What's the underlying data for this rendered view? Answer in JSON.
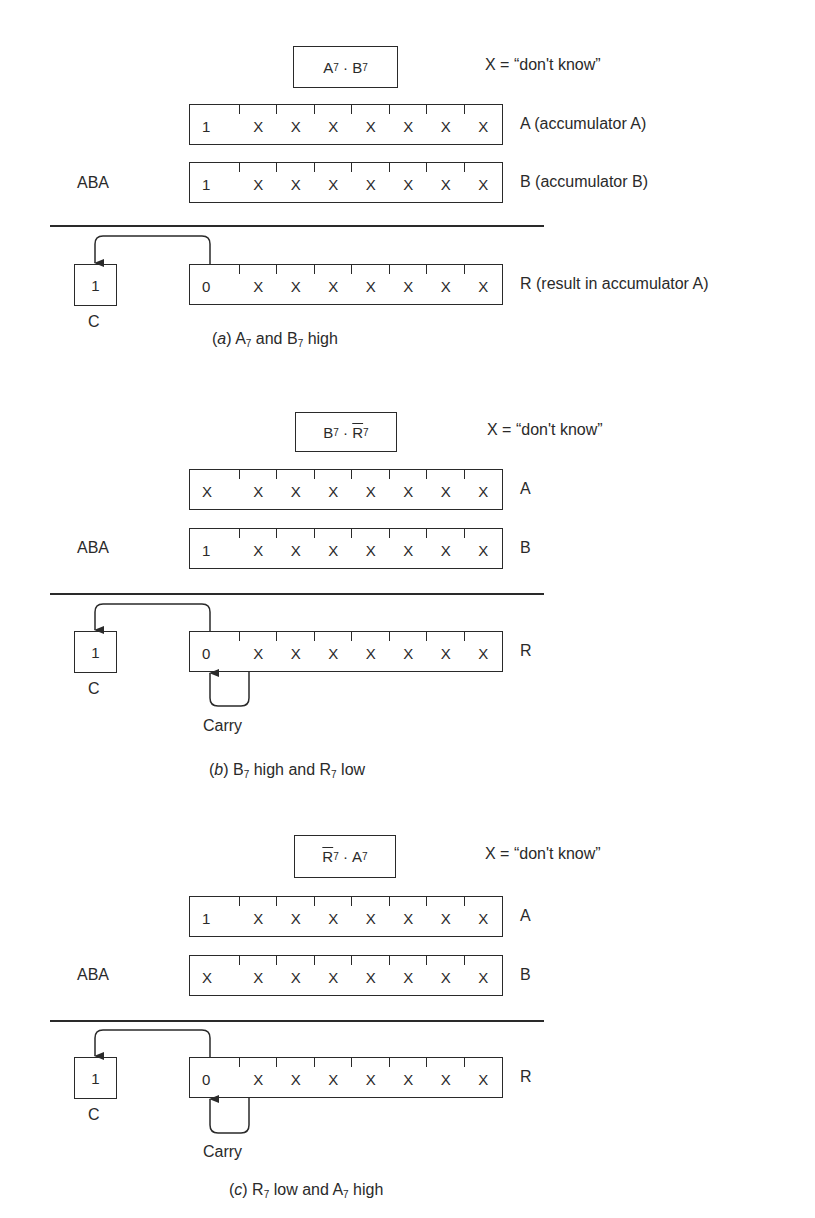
{
  "legend": "X = “don't know”",
  "operation": "ABA",
  "carry_flag_label": "C",
  "carry_text": "Carry",
  "panels": [
    {
      "id": "a",
      "condition": {
        "t1": "A",
        "s1": "7",
        "dot": "·",
        "t2": "B",
        "s2": "7",
        "overline": "none"
      },
      "registers": [
        {
          "name": "A",
          "label": "A (accumulator A)",
          "bits": [
            "1",
            "X",
            "X",
            "X",
            "X",
            "X",
            "X",
            "X"
          ]
        },
        {
          "name": "B",
          "label": "B (accumulator B)",
          "bits": [
            "1",
            "X",
            "X",
            "X",
            "X",
            "X",
            "X",
            "X"
          ]
        },
        {
          "name": "R",
          "label": "R (result in accumulator A)",
          "bits": [
            "0",
            "X",
            "X",
            "X",
            "X",
            "X",
            "X",
            "X"
          ]
        }
      ],
      "carry_value": "1",
      "caption": {
        "letter": "a",
        "text": "A₇ and B₇ high",
        "p1": "A",
        "s1": "7",
        "mid": " and ",
        "p2": "B",
        "s2": "7",
        "end": " high"
      },
      "has_internal_carry": false
    },
    {
      "id": "b",
      "condition": {
        "t1": "B",
        "s1": "7",
        "dot": "·",
        "t2": "R",
        "s2": "7",
        "overline": "second"
      },
      "registers": [
        {
          "name": "A",
          "label": "A",
          "bits": [
            "X",
            "X",
            "X",
            "X",
            "X",
            "X",
            "X",
            "X"
          ]
        },
        {
          "name": "B",
          "label": "B",
          "bits": [
            "1",
            "X",
            "X",
            "X",
            "X",
            "X",
            "X",
            "X"
          ]
        },
        {
          "name": "R",
          "label": "R",
          "bits": [
            "0",
            "X",
            "X",
            "X",
            "X",
            "X",
            "X",
            "X"
          ]
        }
      ],
      "carry_value": "1",
      "caption": {
        "letter": "b",
        "p1": "B",
        "s1": "7",
        "mid": " high and ",
        "p2": "R",
        "s2": "7",
        "end": " low"
      },
      "has_internal_carry": true
    },
    {
      "id": "c",
      "condition": {
        "t1": "R",
        "s1": "7",
        "dot": "·",
        "t2": "A",
        "s2": "7",
        "overline": "first"
      },
      "registers": [
        {
          "name": "A",
          "label": "A",
          "bits": [
            "1",
            "X",
            "X",
            "X",
            "X",
            "X",
            "X",
            "X"
          ]
        },
        {
          "name": "B",
          "label": "B",
          "bits": [
            "X",
            "X",
            "X",
            "X",
            "X",
            "X",
            "X",
            "X"
          ]
        },
        {
          "name": "R",
          "label": "R",
          "bits": [
            "0",
            "X",
            "X",
            "X",
            "X",
            "X",
            "X",
            "X"
          ]
        }
      ],
      "carry_value": "1",
      "caption": {
        "letter": "c",
        "p1": "R",
        "s1": "7",
        "mid": " low and ",
        "p2": "A",
        "s2": "7",
        "end": " high"
      },
      "has_internal_carry": true
    }
  ]
}
